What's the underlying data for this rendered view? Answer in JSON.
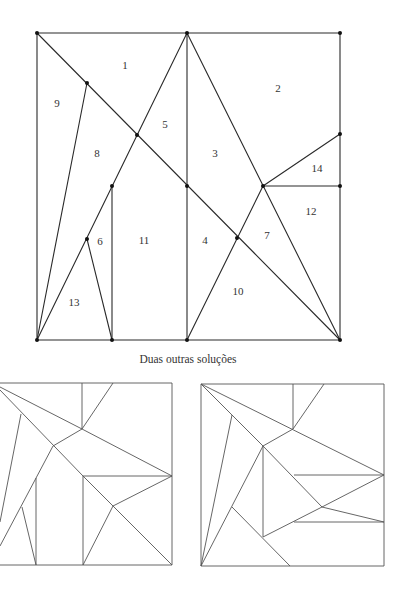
{
  "figure_main": {
    "frame": [
      [
        37,
        33
      ],
      [
        340,
        33
      ],
      [
        340,
        340
      ],
      [
        37,
        340
      ]
    ],
    "segments": [
      [
        37,
        33,
        340,
        340
      ],
      [
        187,
        33,
        187,
        340
      ],
      [
        187,
        33,
        37,
        340
      ],
      [
        187,
        33,
        340,
        340
      ],
      [
        263,
        186,
        187,
        340
      ],
      [
        263,
        186,
        340,
        134
      ],
      [
        263,
        186,
        340,
        186
      ],
      [
        87,
        83,
        37,
        340
      ],
      [
        112,
        186,
        112,
        340
      ],
      [
        87,
        239,
        112,
        340
      ]
    ],
    "vertices": [
      [
        37,
        33
      ],
      [
        187,
        33
      ],
      [
        340,
        33
      ],
      [
        87,
        83
      ],
      [
        137,
        135
      ],
      [
        112,
        186
      ],
      [
        187,
        186
      ],
      [
        263,
        186
      ],
      [
        340,
        134
      ],
      [
        340,
        186
      ],
      [
        87,
        239
      ],
      [
        237,
        238
      ],
      [
        37,
        340
      ],
      [
        112,
        340
      ],
      [
        187,
        340
      ],
      [
        340,
        340
      ]
    ],
    "labels": [
      {
        "text": "1",
        "x": 125,
        "y": 66
      },
      {
        "text": "2",
        "x": 278,
        "y": 89
      },
      {
        "text": "3",
        "x": 215,
        "y": 154
      },
      {
        "text": "4",
        "x": 205,
        "y": 241
      },
      {
        "text": "5",
        "x": 165,
        "y": 125
      },
      {
        "text": "6",
        "x": 100,
        "y": 242
      },
      {
        "text": "7",
        "x": 267,
        "y": 236
      },
      {
        "text": "8",
        "x": 97,
        "y": 154
      },
      {
        "text": "9",
        "x": 57,
        "y": 104
      },
      {
        "text": "10",
        "x": 238,
        "y": 292
      },
      {
        "text": "11",
        "x": 144,
        "y": 241
      },
      {
        "text": "12",
        "x": 311,
        "y": 212
      },
      {
        "text": "13",
        "x": 74,
        "y": 303
      },
      {
        "text": "14",
        "x": 317,
        "y": 169
      }
    ]
  },
  "caption": "Duas outras soluções",
  "figure_left": {
    "segments": [
      [
        0,
        383,
        172,
        383
      ],
      [
        172,
        383,
        172,
        565
      ],
      [
        0,
        565,
        172,
        565
      ],
      [
        82,
        383,
        82,
        429
      ],
      [
        82,
        429,
        113,
        383
      ],
      [
        0,
        387,
        82,
        429
      ],
      [
        82,
        429,
        172,
        476
      ],
      [
        0,
        390,
        83,
        476
      ],
      [
        53,
        446,
        82,
        429
      ],
      [
        53,
        446,
        0,
        546
      ],
      [
        21,
        414,
        0,
        522
      ],
      [
        36,
        478,
        36,
        565
      ],
      [
        22,
        507,
        36,
        565
      ],
      [
        83,
        476,
        172,
        476
      ],
      [
        83,
        476,
        83,
        565
      ],
      [
        83,
        476,
        172,
        565
      ],
      [
        113,
        506,
        172,
        476
      ],
      [
        113,
        506,
        83,
        565
      ]
    ]
  },
  "figure_right": {
    "segments": [
      [
        201,
        384,
        384,
        384
      ],
      [
        384,
        384,
        384,
        566
      ],
      [
        201,
        566,
        384,
        566
      ],
      [
        201,
        384,
        201,
        566
      ],
      [
        293,
        384,
        293,
        429
      ],
      [
        293,
        429,
        324,
        384
      ],
      [
        201,
        384,
        384,
        475
      ],
      [
        201,
        384,
        263,
        446
      ],
      [
        232,
        415,
        201,
        566
      ],
      [
        263,
        446,
        293,
        429
      ],
      [
        263,
        446,
        201,
        566
      ],
      [
        263,
        446,
        263,
        537
      ],
      [
        263,
        446,
        322,
        507
      ],
      [
        294,
        475,
        384,
        475
      ],
      [
        322,
        507,
        384,
        475
      ],
      [
        322,
        507,
        384,
        522
      ],
      [
        294,
        522,
        384,
        522
      ],
      [
        263,
        537,
        322,
        507
      ],
      [
        232,
        507,
        290,
        566
      ]
    ]
  }
}
